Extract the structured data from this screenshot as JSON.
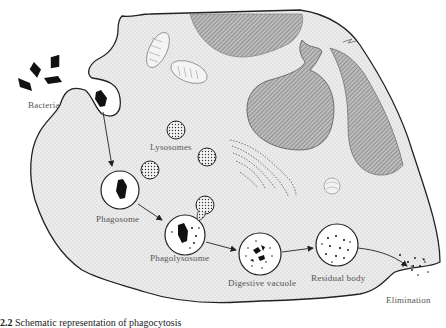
{
  "figure": {
    "type": "diagram",
    "labels": {
      "bacteria": "Bacteria",
      "lysosomes": "Lysosomes",
      "phagosome": "Phagosome",
      "phagolysosome": "Phagolysosome",
      "digestive_vacuole": "Digestive vacuole",
      "residual_body": "Residual body",
      "elimination": "Elimination"
    },
    "caption": {
      "number": "2.2",
      "text": "Schematic representation of phagocytosis"
    },
    "sequence": [
      "Bacteria",
      "Phagosome",
      "Phagolysosome",
      "Digestive vacuole",
      "Residual body",
      "Elimination"
    ],
    "colors": {
      "cytoplasm": "#e6e6e6",
      "nucleus_hatch": "#8a8a8a",
      "outline": "#222222",
      "bacteria": "#111111",
      "label": "#555555"
    }
  }
}
